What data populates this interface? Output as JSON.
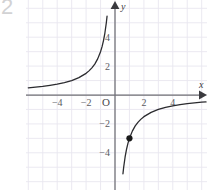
{
  "figure": {
    "corner_number": "2",
    "background_color": "#ffffff",
    "grid_color": "#e9e6ef",
    "axis_color": "#6f6f75",
    "curve_color": "#2b2b2f",
    "point_color": "#1a1a1a",
    "label_color": "#5b5b5f"
  },
  "chart_data": {
    "type": "line",
    "title": "",
    "subtitle": "",
    "xlabel": "x",
    "ylabel": "y",
    "grid": true,
    "legend": null,
    "origin_label": "O",
    "xlim": [
      -6,
      6.3
    ],
    "ylim": [
      -6.5,
      6.5
    ],
    "x_ticks": [
      -4,
      -2,
      2,
      4
    ],
    "x_tick_labels": [
      "−4",
      "−2",
      "2",
      "4"
    ],
    "y_ticks": [
      -4,
      -2,
      2,
      4
    ],
    "y_tick_labels": [
      "−4",
      "−2",
      "2",
      "4"
    ],
    "grid_step": 1,
    "axis_arrows": [
      "x-positive",
      "y-positive"
    ],
    "series": [
      {
        "name": "branch-left",
        "equation": "y = -3/x",
        "quadrant": "II",
        "x": [
          -6.0,
          -5.5,
          -5.0,
          -4.5,
          -4.0,
          -3.5,
          -3.0,
          -2.5,
          -2.0,
          -1.8,
          -1.6,
          -1.4,
          -1.2,
          -1.0,
          -0.9,
          -0.8,
          -0.7,
          -0.6,
          -0.55
        ],
        "y": [
          0.5,
          0.55,
          0.6,
          0.67,
          0.75,
          0.86,
          1.0,
          1.2,
          1.5,
          1.67,
          1.88,
          2.14,
          2.5,
          3.0,
          3.33,
          3.75,
          4.29,
          5.0,
          5.45
        ]
      },
      {
        "name": "branch-right",
        "equation": "y = -3/x",
        "quadrant": "IV",
        "x": [
          0.55,
          0.6,
          0.7,
          0.8,
          0.9,
          1.0,
          1.2,
          1.4,
          1.6,
          1.8,
          2.0,
          2.5,
          3.0,
          3.5,
          4.0,
          4.5,
          5.0,
          5.5,
          6.0,
          6.3
        ],
        "y": [
          -5.45,
          -5.0,
          -4.29,
          -3.75,
          -3.33,
          -3.0,
          -2.5,
          -2.14,
          -1.88,
          -1.67,
          -1.5,
          -1.2,
          -1.0,
          -0.86,
          -0.75,
          -0.67,
          -0.6,
          -0.55,
          -0.5,
          -0.48
        ]
      }
    ],
    "annotations": [
      {
        "name": "marked-point",
        "kind": "filled-point",
        "x": 1,
        "y": -3,
        "label": ""
      }
    ]
  }
}
